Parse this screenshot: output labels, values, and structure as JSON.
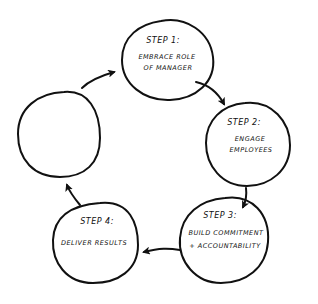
{
  "diagram": {
    "type": "cycle",
    "colors": {
      "stroke": "#111111",
      "background": "#ffffff"
    },
    "steps": [
      {
        "title": "STEP 1:",
        "lines": [
          "EMBRACE ROLE",
          "OF MANAGER"
        ]
      },
      {
        "title": "STEP 2:",
        "lines": [
          "ENGAGE",
          "EMPLOYEES"
        ]
      },
      {
        "title": "STEP 3:",
        "lines": [
          "BUILD COMMITMENT",
          "+ ACCOUNTABILITY"
        ]
      },
      {
        "title": "STEP 4:",
        "lines": [
          "DELIVER RESULTS"
        ]
      },
      {
        "title": "",
        "lines": []
      }
    ],
    "arrows": [
      {
        "from": "step-1",
        "to": "step-2"
      },
      {
        "from": "step-2",
        "to": "step-3"
      },
      {
        "from": "step-3",
        "to": "step-4"
      },
      {
        "from": "step-4",
        "to": "empty-step"
      },
      {
        "from": "empty-step",
        "to": "step-1"
      }
    ]
  }
}
